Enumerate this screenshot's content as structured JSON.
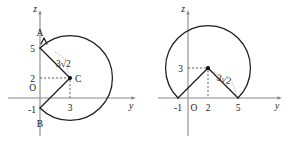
{
  "document": {
    "title": "Two coordinate-plane circle diagrams",
    "background_color": "#ffffff",
    "ink_color": "#1a1a1a",
    "axis_color": "#8a8a8a"
  },
  "figures": [
    {
      "id": "left-figure",
      "axes": {
        "vertical_label": "z",
        "horizontal_label": "y",
        "origin_label": "O"
      },
      "tick_labels": {
        "z_five": "5",
        "z_two": "2",
        "z_minus_one": "-1",
        "y_three": "3"
      },
      "points": [
        {
          "name": "A",
          "label": "A",
          "y": 0,
          "z": 5
        },
        {
          "name": "B",
          "label": "B",
          "y": 0,
          "z": -1
        },
        {
          "name": "C",
          "label": "C",
          "y": 3,
          "z": 2
        }
      ],
      "radius_label": "3√2",
      "radius_value": "3√2",
      "circle": {
        "center_y": 3,
        "center_z": 2,
        "radius": 4.243
      },
      "shape": "circle with wedge removed between A(0,5) and B(0,-1) through center C(3,2)"
    },
    {
      "id": "right-figure",
      "axes": {
        "vertical_label": "z",
        "horizontal_label": "y",
        "origin_label": "O"
      },
      "tick_labels": {
        "z_three": "3",
        "y_minus_one": "-1",
        "y_two": "2",
        "y_five": "5"
      },
      "points": [
        {
          "name": "left-foot",
          "label": "-1",
          "y": -1,
          "z": 0
        },
        {
          "name": "apex",
          "label": "2",
          "y": 2,
          "z": 3
        },
        {
          "name": "right-foot",
          "label": "5",
          "y": 5,
          "z": 0
        }
      ],
      "radius_label": "3√2",
      "radius_value": "3√2",
      "circle": {
        "center_y": 2,
        "center_z": 3,
        "radius": 4.243
      },
      "shape": "circle with wedge removed between (-1,0) and (5,0) through center (2,3)"
    }
  ]
}
